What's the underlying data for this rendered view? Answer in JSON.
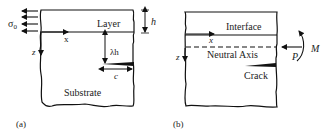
{
  "panel_a": {
    "caption": "(a)",
    "layer_label": "Layer",
    "substrate_label": "Substrate",
    "stress_label": "σ",
    "stress_subscript": "0",
    "thickness_label": "h",
    "crack_depth_label": "λh",
    "crack_length_label": "c",
    "x_axis_label": "x",
    "z_axis_label": "z"
  },
  "panel_b": {
    "caption": "(b)",
    "interface_label": "Interface",
    "neutral_axis_label": "Neutral Axis",
    "crack_label": "Crack",
    "force_label": "P",
    "moment_label": "M",
    "x_axis_label": "x",
    "z_axis_label": "z"
  },
  "colors": {
    "ink": "#111111",
    "text": "#222222",
    "background": "#ffffff"
  }
}
